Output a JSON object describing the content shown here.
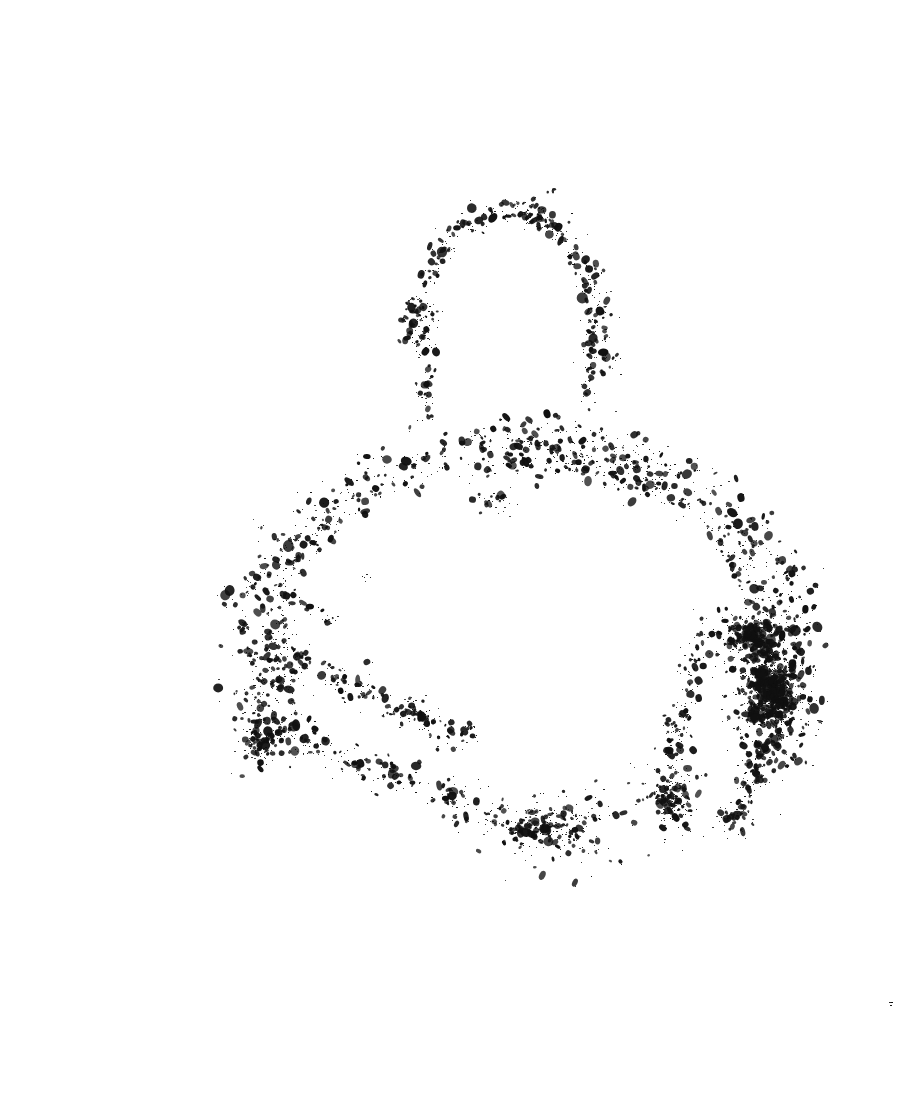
{
  "document": {
    "title": "Binarized Speckle Scan",
    "width": 914,
    "height": 1100,
    "background_color": "#ffffff",
    "ink_color": "#101010",
    "description": "Heavily thresholded scanned artwork rendered as sparse black speckles on a blank white page",
    "visible_text": ""
  },
  "chart_data": {
    "type": "scatter",
    "title": "",
    "subtitle": "",
    "xlabel": "",
    "ylabel": "",
    "grid": false,
    "legend_position": "none",
    "xlim": [
      0,
      914
    ],
    "ylim": [
      0,
      1100
    ],
    "axes_visible": false,
    "tick_labels_x": [],
    "tick_labels_y": [],
    "annotations": [],
    "marker_color": "#101010",
    "background_color": "#ffffff",
    "point_size_range": [
      0.6,
      4.2
    ],
    "total_point_estimate": 2600,
    "structures": [
      {
        "name": "upper-arc",
        "shape": "arc",
        "center_x": 508,
        "center_y": 360,
        "radius_x": 98,
        "radius_y": 150,
        "angle_start": 186,
        "angle_end": 366,
        "band_width": 26,
        "density": 560,
        "intensity": 0.72,
        "bbox": [
          405,
          192,
          615,
          420
        ]
      },
      {
        "name": "upper-arc-left-tail",
        "shape": "streak",
        "x1": 430,
        "y1": 300,
        "x2": 422,
        "y2": 420,
        "band_width": 16,
        "density": 80,
        "intensity": 0.5,
        "bbox": [
          408,
          295,
          448,
          425
        ]
      },
      {
        "name": "upper-arc-right-tail",
        "shape": "streak",
        "x1": 592,
        "y1": 305,
        "x2": 585,
        "y2": 400,
        "band_width": 18,
        "density": 70,
        "intensity": 0.55,
        "bbox": [
          566,
          300,
          612,
          408
        ]
      },
      {
        "name": "mid-gap-speck",
        "shape": "blob",
        "center_x": 493,
        "center_y": 500,
        "radius_x": 30,
        "radius_y": 18,
        "density": 34,
        "intensity": 0.3,
        "bbox": [
          462,
          480,
          528,
          522
        ]
      },
      {
        "name": "mid-gap-trace",
        "shape": "streak",
        "x1": 481,
        "y1": 432,
        "x2": 487,
        "y2": 470,
        "band_width": 8,
        "density": 8,
        "intensity": 0.2,
        "bbox": [
          476,
          428,
          494,
          474
        ]
      },
      {
        "name": "lower-arc-main",
        "shape": "arc",
        "center_x": 522,
        "center_y": 640,
        "radius_x": 268,
        "radius_y": 196,
        "angle_start": 152,
        "angle_end": 392,
        "band_width": 58,
        "density": 1250,
        "intensity": 0.8,
        "bbox": [
          238,
          590,
          808,
          870
        ]
      },
      {
        "name": "lower-arc-inner-band",
        "shape": "arc",
        "center_x": 520,
        "center_y": 628,
        "radius_x": 238,
        "radius_y": 168,
        "angle_start": 160,
        "angle_end": 385,
        "band_width": 30,
        "density": 420,
        "intensity": 0.62,
        "bbox": [
          268,
          606,
          782,
          830
        ]
      },
      {
        "name": "lower-arc-left-upper-streak",
        "shape": "streak",
        "x1": 268,
        "y1": 646,
        "x2": 470,
        "y2": 742,
        "band_width": 30,
        "density": 240,
        "intensity": 0.66,
        "bbox": [
          250,
          626,
          492,
          762
        ]
      },
      {
        "name": "lower-arc-left-lower-streak",
        "shape": "streak",
        "x1": 262,
        "y1": 724,
        "x2": 520,
        "y2": 830,
        "band_width": 30,
        "density": 250,
        "intensity": 0.66,
        "bbox": [
          244,
          704,
          540,
          850
        ]
      },
      {
        "name": "lower-arc-bottom-dense",
        "shape": "blob",
        "center_x": 545,
        "center_y": 828,
        "radius_x": 70,
        "radius_y": 30,
        "density": 230,
        "intensity": 0.78,
        "bbox": [
          472,
          792,
          618,
          862
        ]
      },
      {
        "name": "right-dense-cluster",
        "shape": "blob",
        "center_x": 772,
        "center_y": 690,
        "radius_x": 34,
        "radius_y": 56,
        "density": 620,
        "intensity": 1.0,
        "bbox": [
          732,
          620,
          812,
          756
        ]
      },
      {
        "name": "right-cluster-upper",
        "shape": "blob",
        "center_x": 748,
        "center_y": 634,
        "radius_x": 30,
        "radius_y": 22,
        "density": 180,
        "intensity": 0.82,
        "bbox": [
          712,
          608,
          786,
          662
        ]
      },
      {
        "name": "right-arc-tail",
        "shape": "streak",
        "x1": 766,
        "y1": 748,
        "x2": 728,
        "y2": 838,
        "band_width": 26,
        "density": 150,
        "intensity": 0.6,
        "bbox": [
          702,
          736,
          792,
          854
        ]
      },
      {
        "name": "right-inner-hook",
        "shape": "streak",
        "x1": 700,
        "y1": 640,
        "x2": 672,
        "y2": 760,
        "band_width": 22,
        "density": 120,
        "intensity": 0.5,
        "bbox": [
          650,
          624,
          722,
          776
        ]
      },
      {
        "name": "bottom-right-cluster",
        "shape": "blob",
        "center_x": 672,
        "center_y": 800,
        "radius_x": 30,
        "radius_y": 34,
        "density": 170,
        "intensity": 0.7,
        "bbox": [
          638,
          762,
          708,
          842
        ]
      },
      {
        "name": "lower-arc-left-tip",
        "shape": "blob",
        "center_x": 258,
        "center_y": 742,
        "radius_x": 24,
        "radius_y": 26,
        "density": 90,
        "intensity": 0.58,
        "bbox": [
          232,
          712,
          286,
          772
        ]
      },
      {
        "name": "lower-arc-top-left-wisp",
        "shape": "streak",
        "x1": 300,
        "y1": 604,
        "x2": 338,
        "y2": 624,
        "band_width": 14,
        "density": 26,
        "intensity": 0.35,
        "bbox": [
          288,
          596,
          350,
          632
        ]
      },
      {
        "name": "stray-speck-top-left",
        "shape": "blob",
        "center_x": 363,
        "center_y": 578,
        "radius_x": 7,
        "radius_y": 5,
        "density": 5,
        "intensity": 0.3,
        "bbox": [
          356,
          572,
          372,
          584
        ]
      },
      {
        "name": "stray-speck-upper-right",
        "shape": "blob",
        "center_x": 551,
        "center_y": 192,
        "radius_x": 5,
        "radius_y": 4,
        "density": 3,
        "intensity": 0.25,
        "bbox": [
          546,
          188,
          558,
          197
        ]
      },
      {
        "name": "faint-artifact-right-margin",
        "shape": "blob",
        "center_x": 891,
        "center_y": 1003,
        "radius_x": 4,
        "radius_y": 7,
        "density": 3,
        "intensity": 0.1,
        "bbox": [
          886,
          995,
          897,
          1012
        ]
      }
    ]
  }
}
